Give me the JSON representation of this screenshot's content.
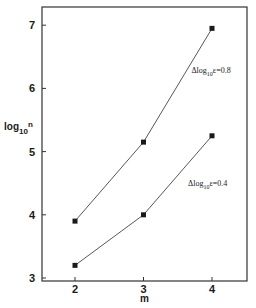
{
  "chart_data": {
    "type": "line",
    "title": "",
    "xlabel": "m",
    "ylabel": "log10n",
    "ylabel_parts": {
      "base": "log",
      "sub": "10",
      "sup": "n"
    },
    "x": [
      2,
      3,
      4
    ],
    "xticks": [
      "2",
      "3",
      "4"
    ],
    "yticks": [
      "3",
      "4",
      "5",
      "6",
      "7"
    ],
    "xlim": [
      1.55,
      4.5
    ],
    "ylim": [
      3,
      7.3
    ],
    "grid": false,
    "legend": null,
    "series": [
      {
        "name": "Δlog10ε=0.8",
        "values": [
          3.9,
          5.15,
          6.95
        ],
        "marker": "square",
        "color": "#1a1a1a"
      },
      {
        "name": "Δlog10ε=0.4",
        "values": [
          3.2,
          4.0,
          5.25
        ],
        "marker": "square",
        "color": "#1a1a1a"
      }
    ],
    "annotations": [
      {
        "text": "Δlog10ε=0.8",
        "parts": {
          "pre": "Δlog",
          "sub": "10",
          "post": "ε=0.8"
        },
        "x": 3.7,
        "y": 6.25
      },
      {
        "text": "Δlog10ε=0.4",
        "parts": {
          "pre": "Δlog",
          "sub": "10",
          "post": "ε=0.4"
        },
        "x": 3.65,
        "y": 4.45
      }
    ]
  }
}
